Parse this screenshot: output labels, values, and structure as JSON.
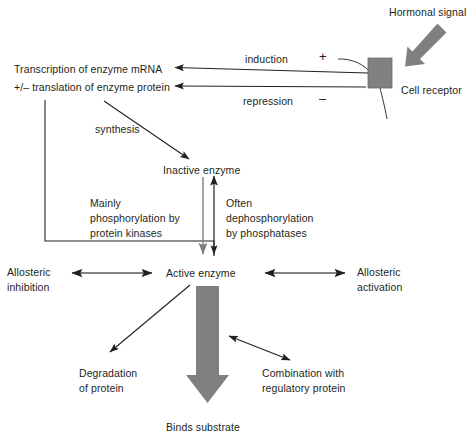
{
  "diagram": {
    "colors": {
      "line": "#231f20",
      "text": "#231f20",
      "receptor_fill": "#808080",
      "block_arrow_fill": "#808080",
      "gray_arrow": "#7d7d7d",
      "background": "#ffffff"
    },
    "labels": {
      "hormonal_signal": "Hormonal signal",
      "cell_receptor": "Cell receptor",
      "induction": "induction",
      "induction_sign": "+",
      "repression": "repression",
      "repression_sign": "–",
      "transcription_line1": "Transcription of enzyme mRNA",
      "transcription_line2": "+/– translation of enzyme protein",
      "synthesis": "synthesis",
      "inactive_enzyme": "Inactive enzyme",
      "active_enzyme": "Active enzyme",
      "mainly_line1": "Mainly",
      "mainly_line2": "phosphorylation by",
      "mainly_line3": "protein kinases",
      "often_line1": "Often",
      "often_line2": "dephosphorylation",
      "often_line3": "by phosphatases",
      "allosteric_inhibition_line1": "Allosteric",
      "allosteric_inhibition_line2": "inhibition",
      "allosteric_activation_line1": "Allosteric",
      "allosteric_activation_line2": "activation",
      "degradation_line1": "Degradation",
      "degradation_line2": "of protein",
      "combination_line1": "Combination with",
      "combination_line2": "regulatory protein",
      "binds_substrate": "Binds substrate"
    }
  }
}
